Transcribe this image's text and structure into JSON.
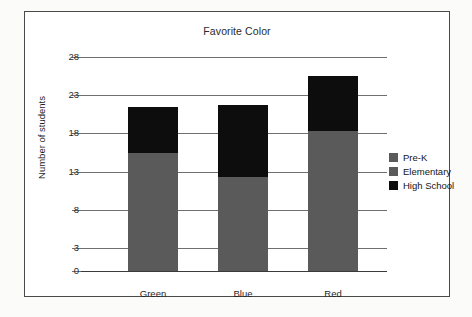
{
  "chart_data": {
    "type": "bar",
    "subtype": "stacked-bar",
    "title": "Favorite Color",
    "xlabel": "",
    "ylabel": "Number of students",
    "categories": [
      "Green",
      "Blue",
      "Red"
    ],
    "series": [
      {
        "name": "Pre-K",
        "color": "#5a5a5a",
        "values": [
          0,
          0,
          0
        ]
      },
      {
        "name": "Elementary",
        "color": "#5a5a5a",
        "values": [
          15.4,
          12.3,
          18.3
        ]
      },
      {
        "name": "High School",
        "color": "#0d0d0d",
        "values": [
          6.1,
          9.4,
          7.2
        ]
      }
    ],
    "totals": [
      21.5,
      21.7,
      25.5
    ],
    "ylim": [
      0,
      28
    ],
    "yticks": [
      0,
      3,
      8,
      13,
      18,
      23,
      28
    ],
    "ytick_labels": [
      "0",
      "3",
      "8",
      "13",
      "18",
      "23",
      "28"
    ],
    "grid": true,
    "legend_position": "right"
  },
  "legend": {
    "entries": [
      {
        "label": "Pre-K",
        "color": "#5a5a5a"
      },
      {
        "label": "Elementary",
        "color": "#5a5a5a"
      },
      {
        "label": "High School",
        "color": "#0d0d0d"
      }
    ]
  },
  "colors": {
    "gray": "#5a5a5a",
    "black": "#0d0d0d",
    "gridline": "#6f6f6f",
    "axis": "#3a3a3a",
    "frame": "#4a4a4a",
    "page_background": "#fbfbfa",
    "plot_background": "#ffffff"
  }
}
